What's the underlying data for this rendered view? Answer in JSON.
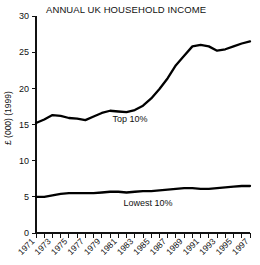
{
  "chart_data": {
    "type": "line",
    "title": "ANNUAL UK HOUSEHOLD INCOME",
    "xlabel": "",
    "ylabel": "£ (000) (1999)",
    "ylim": [
      0,
      30
    ],
    "xlim": [
      1971,
      1997
    ],
    "yticks": [
      0,
      5,
      10,
      15,
      20,
      25,
      30
    ],
    "grid": false,
    "legend_position": "inline-annotation",
    "x": [
      1971,
      1972,
      1973,
      1974,
      1975,
      1976,
      1977,
      1978,
      1979,
      1980,
      1981,
      1982,
      1983,
      1984,
      1985,
      1986,
      1987,
      1988,
      1989,
      1990,
      1991,
      1992,
      1993,
      1994,
      1995,
      1996,
      1997
    ],
    "xtick_labels": [
      "1971",
      "1973",
      "1975",
      "1977",
      "1979",
      "1981",
      "1983",
      "1985",
      "1987",
      "1989",
      "1991",
      "1993",
      "1995",
      "1997"
    ],
    "series": [
      {
        "name": "Top 10%",
        "annotation": "Top 10%",
        "values": [
          15.2,
          15.7,
          16.3,
          16.2,
          15.9,
          15.8,
          15.6,
          16.1,
          16.6,
          16.9,
          16.8,
          16.7,
          17.0,
          17.6,
          18.6,
          19.9,
          21.4,
          23.2,
          24.5,
          25.8,
          26.0,
          25.8,
          25.2,
          25.4,
          25.8,
          26.2,
          26.5
        ]
      },
      {
        "name": "Lowest 10%",
        "annotation": "Lowest 10%",
        "values": [
          5.0,
          5.0,
          5.2,
          5.4,
          5.5,
          5.5,
          5.5,
          5.5,
          5.6,
          5.7,
          5.7,
          5.6,
          5.7,
          5.8,
          5.8,
          5.9,
          6.0,
          6.1,
          6.2,
          6.2,
          6.1,
          6.1,
          6.2,
          6.3,
          6.4,
          6.5,
          6.5
        ]
      }
    ]
  }
}
